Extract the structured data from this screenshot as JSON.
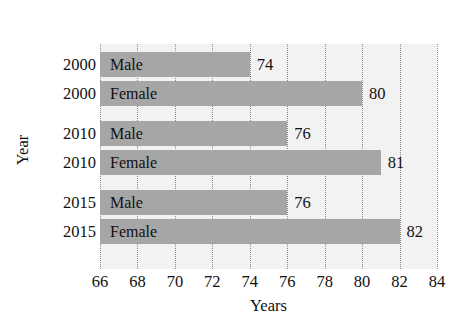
{
  "title": {
    "line1": "the United States",
    "line2": ""
  },
  "chart_data": {
    "type": "bar",
    "orientation": "horizontal",
    "title": "the United States",
    "xlabel": "Years",
    "ylabel": "Year",
    "xlim": [
      66,
      84
    ],
    "xticks": [
      66,
      68,
      70,
      72,
      74,
      76,
      78,
      80,
      82,
      84
    ],
    "grid": true,
    "grid_axis": "x",
    "legend": null,
    "bar_color": "#a6a6a6",
    "plot_background": "#f2f2f2",
    "categories": [
      "2000",
      "2000",
      "2010",
      "2010",
      "2015",
      "2015"
    ],
    "groups": [
      "Male",
      "Female",
      "Male",
      "Female",
      "Male",
      "Female"
    ],
    "values": [
      74,
      80,
      76,
      81,
      76,
      82
    ],
    "bars": [
      {
        "year": "2000",
        "group": "Male",
        "value": 74,
        "value_label": "74"
      },
      {
        "year": "2000",
        "group": "Female",
        "value": 80,
        "value_label": "80"
      },
      {
        "year": "2010",
        "group": "Male",
        "value": 76,
        "value_label": "76"
      },
      {
        "year": "2010",
        "group": "Female",
        "value": 81,
        "value_label": "81"
      },
      {
        "year": "2015",
        "group": "Male",
        "value": 76,
        "value_label": "76"
      },
      {
        "year": "2015",
        "group": "Female",
        "value": 82,
        "value_label": "82"
      }
    ]
  }
}
